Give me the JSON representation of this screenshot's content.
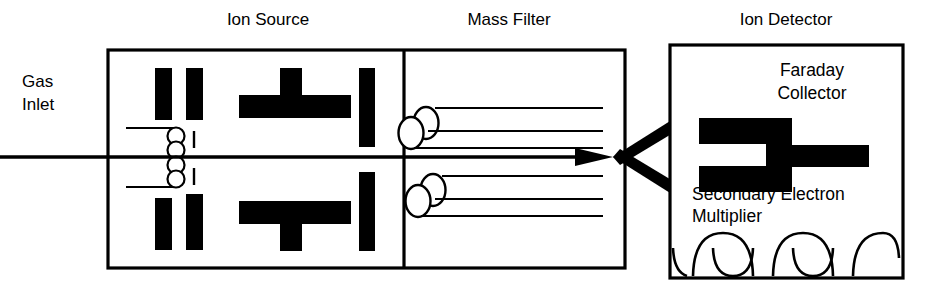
{
  "diagram": {
    "title_labels": {
      "ion_source": "Ion Source",
      "mass_filter": "Mass Filter",
      "ion_detector": "Ion Detector"
    },
    "inlet": {
      "line1": "Gas",
      "line2": "Inlet"
    },
    "detector_labels": {
      "faraday_line1": "Faraday",
      "faraday_line2": "Collector",
      "sem_line1": "Secondary Electron",
      "sem_line2": "Multiplier"
    },
    "colors": {
      "ink": "#000000",
      "paper": "#ffffff"
    }
  }
}
